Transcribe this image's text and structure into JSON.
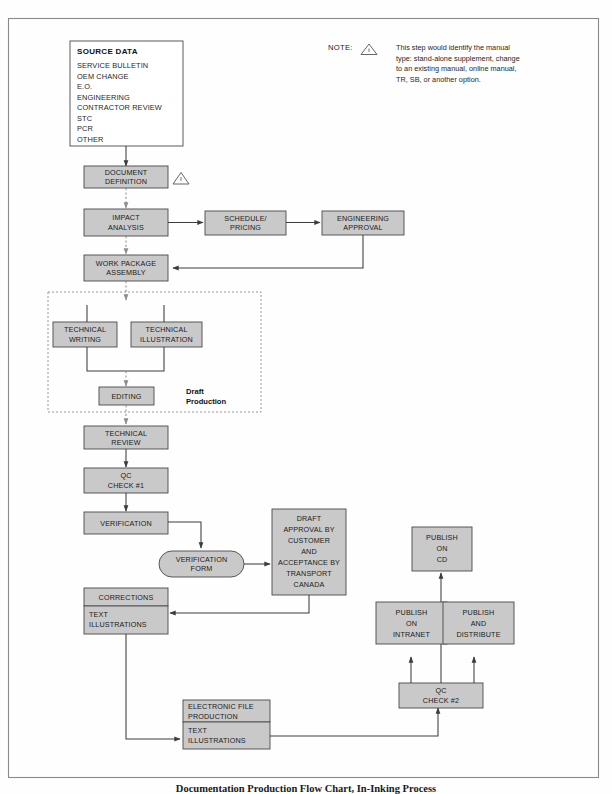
{
  "document": {
    "caption": "Documentation Production Flow Chart, In-Inking Process",
    "border_color": "#8a8a8a"
  },
  "colors": {
    "box_fill": "#c9c9c9",
    "box_stroke": "#4a4a4a",
    "connector": "#3c3c3c",
    "dashed": "#8e8e8e",
    "text": "#1a1a1a"
  },
  "note": {
    "label": "NOTE:",
    "icon": "warning-triangle",
    "lines": [
      "This step would identify the manual",
      "type: stand-alone supplement, change",
      "to an existing manual, online manual,",
      "TR, SB, or another option."
    ]
  },
  "source_data": {
    "title": "SOURCE DATA",
    "items": [
      "SERVICE BULLETIN",
      "OEM CHANGE",
      "E.O.",
      "ENGINEERING",
      "CONTRACTOR REVIEW",
      "STC",
      "PCR",
      "OTHER"
    ]
  },
  "group": {
    "draft_production_label_line1": "Draft",
    "draft_production_label_line2": "Production"
  },
  "nodes": {
    "document_definition": [
      "DOCUMENT",
      "DEFINITION"
    ],
    "impact_analysis": [
      "IMPACT",
      "ANALYSIS"
    ],
    "schedule_pricing": [
      "SCHEDULE/",
      "PRICING"
    ],
    "engineering_approval": [
      "ENGINEERING",
      "APPROVAL"
    ],
    "work_package_assembly": [
      "WORK PACKAGE",
      "ASSEMBLY"
    ],
    "technical_writing": [
      "TECHNICAL",
      "WRITING"
    ],
    "technical_illustration": [
      "TECHNICAL",
      "ILLUSTRATION"
    ],
    "editing": [
      "EDITING"
    ],
    "technical_review": [
      "TECHNICAL",
      "REVIEW"
    ],
    "qc_check_1": [
      "QC",
      "CHECK #1"
    ],
    "verification": [
      "VERIFICATION"
    ],
    "verification_form": [
      "VERIFICATION",
      "FORM"
    ],
    "draft_approval": [
      "DRAFT",
      "APPROVAL BY",
      "CUSTOMER",
      "AND",
      "ACCEPTANCE BY",
      "TRANSPORT",
      "CANADA"
    ],
    "corrections_header": [
      "CORRECTIONS"
    ],
    "corrections_body": [
      "TEXT",
      "ILLUSTRATIONS"
    ],
    "electronic_file_header": [
      "ELECTRONIC FILE",
      "PRODUCTION"
    ],
    "electronic_file_body": [
      "TEXT",
      "ILLUSTRATIONS"
    ],
    "qc_check_2": [
      "QC",
      "CHECK #2"
    ],
    "publish_on_cd": [
      "PUBLISH",
      "ON",
      "CD"
    ],
    "publish_on_intranet": [
      "PUBLISH",
      "ON",
      "INTRANET"
    ],
    "publish_and_distribute": [
      "PUBLISH",
      "AND",
      "DISTRIBUTE"
    ]
  }
}
